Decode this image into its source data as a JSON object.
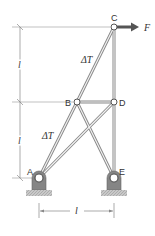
{
  "diagram": {
    "type": "truss",
    "nodes": [
      {
        "id": "A",
        "label": "A",
        "x": 39,
        "y": 178
      },
      {
        "id": "B",
        "label": "B",
        "x": 77,
        "y": 102
      },
      {
        "id": "C",
        "label": "C",
        "x": 114,
        "y": 27
      },
      {
        "id": "D",
        "label": "D",
        "x": 114,
        "y": 102
      },
      {
        "id": "E",
        "label": "E",
        "x": 114,
        "y": 178
      }
    ],
    "members": [
      {
        "from": "A",
        "to": "B",
        "label": "ΔT"
      },
      {
        "from": "B",
        "to": "C",
        "label": "ΔT"
      },
      {
        "from": "B",
        "to": "D",
        "label": ""
      },
      {
        "from": "C",
        "to": "D",
        "label": ""
      },
      {
        "from": "D",
        "to": "E",
        "label": ""
      },
      {
        "from": "A",
        "to": "D",
        "label": ""
      },
      {
        "from": "B",
        "to": "E",
        "label": ""
      }
    ],
    "supports": [
      {
        "node": "A",
        "type": "pin"
      },
      {
        "node": "E",
        "type": "pin"
      }
    ],
    "load": {
      "node": "C",
      "label": "F",
      "direction": "right"
    },
    "member_labels": {
      "upper": "ΔT",
      "lower": "ΔT"
    },
    "dimensions": {
      "vertical_upper": "l",
      "vertical_lower": "l",
      "horizontal": "l"
    },
    "colors": {
      "member": "#8a8a8a",
      "support": "#808080",
      "ground": "#b5b5b5",
      "arrow": "#555555",
      "dim_line": "#888888"
    }
  }
}
